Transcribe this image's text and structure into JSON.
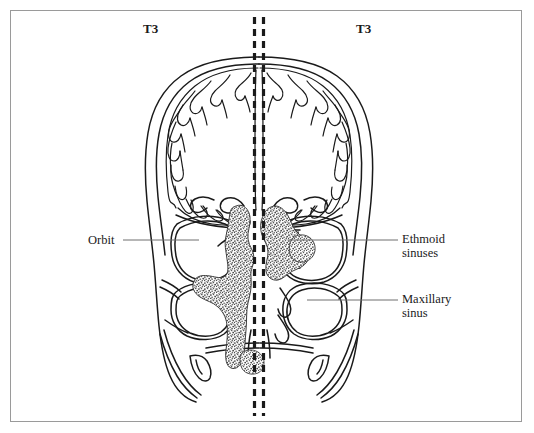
{
  "figure": {
    "type": "coronal-section-anatomical-line-drawing",
    "border_color": "#9a9a9a",
    "background_color": "#ffffff",
    "line_color": "#1a1a1a",
    "leader_line_color": "#6e6e6e",
    "stipple_color": "#6b6b6b"
  },
  "stage_labels": {
    "left": "T3",
    "right": "T3"
  },
  "annotations": [
    {
      "id": "orbit",
      "text": "Orbit",
      "line1": "Orbit",
      "line2": "",
      "side": "left",
      "leader": {
        "x1": 123,
        "y1": 240,
        "x2": 199,
        "y2": 240
      }
    },
    {
      "id": "ethmoid-sinuses",
      "text": "Ethmoid sinuses",
      "line1": "Ethmoid",
      "line2": "sinuses",
      "side": "right",
      "leader": {
        "x1": 288,
        "y1": 240,
        "x2": 398,
        "y2": 240
      }
    },
    {
      "id": "maxillary-sinus",
      "text": "Maxillary sinus",
      "line1": "Maxillary",
      "line2": "sinus",
      "side": "right",
      "leader": {
        "x1": 307,
        "y1": 300,
        "x2": 398,
        "y2": 300
      }
    }
  ],
  "midline": {
    "style": "double-dashed-vertical",
    "x_left": 254,
    "x_right": 264,
    "y_top": 17,
    "y_bottom": 416,
    "dash_length": 7,
    "dash_gap": 5,
    "stroke_width": 3.2,
    "color": "#1a1a1a"
  },
  "tumor": {
    "name": "stippled-tumor-mass",
    "description": "irregular stippled mass crossing the midline through the ethmoid region and nasal cavity",
    "fill": "stipple-texture"
  }
}
